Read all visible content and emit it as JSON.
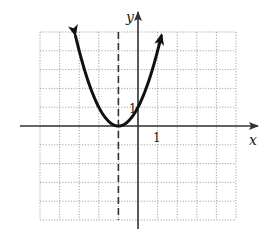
{
  "chart_data": {
    "type": "line",
    "title": "",
    "function": "y = (x + 1)^2",
    "xlabel": "x",
    "ylabel": "y",
    "xlim": [
      -5,
      5
    ],
    "ylim": [
      -5,
      5
    ],
    "grid": true,
    "grid_style": "dotted",
    "tick_labels": [
      {
        "axis": "x",
        "value": 1,
        "label": "1"
      },
      {
        "axis": "y",
        "value": 1,
        "label": "1"
      }
    ],
    "vertex": {
      "x": -1,
      "y": 0
    },
    "axis_of_symmetry": {
      "x": -1,
      "style": "dashed"
    },
    "y_intercept": {
      "x": 0,
      "y": 1
    },
    "series": [
      {
        "name": "parabola",
        "x": [
          -3.2,
          -3,
          -2.5,
          -2,
          -1.5,
          -1,
          -0.5,
          0,
          0.5,
          1,
          1.2
        ],
        "y": [
          4.84,
          4,
          2.25,
          1,
          0.25,
          0,
          0.25,
          1,
          2.25,
          4,
          4.84
        ],
        "arrows": "both ends"
      }
    ],
    "colors": {
      "curve": "#111111",
      "axes": "#333333",
      "grid": "#9a9a9a",
      "dashed_line": "#333333"
    }
  },
  "labels": {
    "x_axis": "x",
    "y_axis": "y",
    "x_tick_1": "1",
    "y_tick_1": "1"
  }
}
